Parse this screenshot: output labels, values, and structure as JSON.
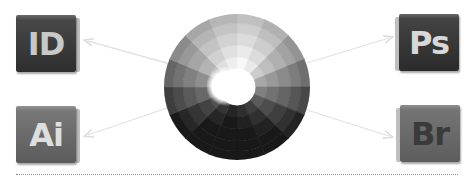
{
  "diagram": {
    "center": {
      "name": "color-wheel",
      "style": "grayscale concentric segmented wheel",
      "colors": {
        "light": "#ffffff",
        "dark": "#1e1e1e"
      }
    },
    "apps": [
      {
        "id": "id",
        "label": "ID",
        "position": "top-left",
        "background": "#3a3a3a",
        "text_color": "#c8c8c8"
      },
      {
        "id": "ai",
        "label": "Ai",
        "position": "bottom-left",
        "background": "#6a6a6a",
        "text_color": "#dedede"
      },
      {
        "id": "ps",
        "label": "Ps",
        "position": "top-right",
        "background": "#383838",
        "text_color": "#d8d8d8"
      },
      {
        "id": "br",
        "label": "Br",
        "position": "bottom-right",
        "background": "#6a6a6a",
        "text_color": "#3a3a3a"
      }
    ],
    "arrows": [
      {
        "from": "color-wheel",
        "to": "ID"
      },
      {
        "from": "color-wheel",
        "to": "Ai"
      },
      {
        "from": "color-wheel",
        "to": "Ps"
      },
      {
        "from": "color-wheel",
        "to": "Br"
      }
    ],
    "arrow_color": "#e2e2e2",
    "divider_style": "dotted"
  }
}
